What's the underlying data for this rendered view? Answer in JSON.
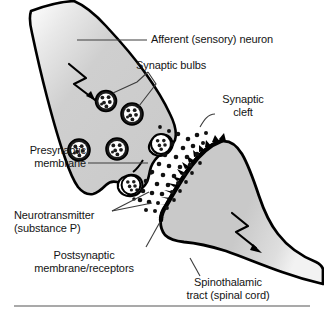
{
  "figure": {
    "background_color": "#ffffff",
    "width": 324,
    "height": 318
  },
  "colors": {
    "neuron_fill": "#c9c9c9",
    "neuron_fill_light": "#d6d6d6",
    "outline": "#000000",
    "text": "#141414",
    "leader_line": "#3c3c3c",
    "cleft_fill": "#ffffff",
    "vesicle_fill": "#1a1a1a",
    "vesicle_granule": "#ffffff",
    "rule": "#8c8c8c"
  },
  "labels": {
    "afferent_neuron": "Afferent (sensory) neuron",
    "synaptic_bulbs": "Synaptic bulbs",
    "synaptic_cleft_line1": "Synaptic",
    "synaptic_cleft_line2": "cleft",
    "presynaptic_membrane_line1": "Presynaptic",
    "presynaptic_membrane_line2": "membrane",
    "neurotransmitter_line1": "Neurotransmitter",
    "neurotransmitter_line2": "(substance P)",
    "postsynaptic_line1": "Postsynaptic",
    "postsynaptic_line2": "membrane/receptors",
    "spinothalamic_line1": "Spinothalamic",
    "spinothalamic_line2": "tract (spinal cord)"
  },
  "structures": {
    "presynaptic_neuron": "afferent sensory neuron terminal",
    "postsynaptic_neuron": "spinothalamic tract neuron",
    "vesicle_count": 5,
    "fusing_vesicle_count": 2,
    "neurotransmitter_dot_count": 44,
    "receptor_spike_count": 15,
    "impulse_arrow_count": 2
  }
}
